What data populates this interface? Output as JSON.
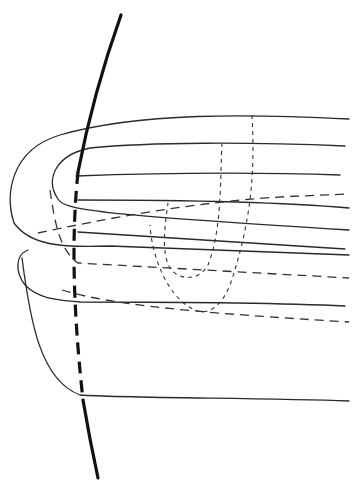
{
  "diagram": {
    "width": 356,
    "height": 497,
    "background": "#ffffff",
    "stroke_color": "#2a2a2a",
    "axis": {
      "solid_upper": "M 121 15 C 105 60, 90 110, 78 172",
      "dashed_middle": "M 78 172 C 72 230, 72 300, 83 400",
      "solid_lower": "M 83 400 C 88 430, 93 455, 98 478"
    },
    "solid_curves": [
      "M 349 119 C 250 114, 140 112, 60 135 C 10 150, 5 195, 14 223 C 30 245, 60 248, 110 246 L 349 255",
      "M 345 146 C 250 142, 150 142, 90 148 C 55 155, 45 180, 58 199 C 65 210, 90 214, 349 230",
      "M 340 175 C 250 172, 160 173, 76 176",
      "M 78 232 L 345 249",
      "M 78 200 C 200 200, 280 202, 349 208",
      "M 28 250 C 15 255, 15 272, 25 285 C 40 300, 60 300, 80 302 C 150 302, 260 302, 345 306",
      "M 22 258 C 30 320, 40 380, 80 395 C 120 398, 260 398, 349 401"
    ],
    "dashed_curves": [
      "M 38 233 C 100 220, 200 200, 300 196 L 349 194",
      "M 50 190 C 55 225, 60 250, 78 263 L 349 278",
      "M 62 290 C 110 305, 200 313, 349 322"
    ],
    "dotted_curves": [
      "M 222 143 C 220 180, 222 230, 208 265 C 200 280, 180 282, 170 268 C 160 250, 166 220, 168 203",
      "M 252 115 C 255 170, 252 220, 230 285 C 220 310, 205 315, 195 310 C 170 300, 152 260, 150 225"
    ]
  }
}
